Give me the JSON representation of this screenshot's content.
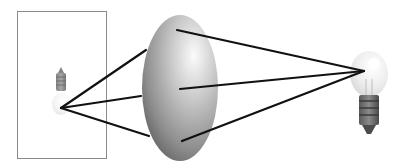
{
  "diagram": {
    "title": "",
    "colors": {
      "background": "#ffffff",
      "frame": "#8a8a8a",
      "rays": "#111111",
      "lens_light": "#f2f2f2",
      "lens_dark": "#6a6a6a"
    },
    "frame": {
      "x": 17,
      "y": 11,
      "width": 89,
      "height": 147
    },
    "object_bulb": {
      "cx": 61,
      "cy": 90,
      "orientation": "upright"
    },
    "lens": {
      "cx": 180,
      "cy": 88,
      "rx": 38,
      "ry": 73
    },
    "left_focus": {
      "x": 61,
      "y": 108
    },
    "right_focus": {
      "x": 364,
      "y": 71
    },
    "image_bulb": {
      "cx": 370,
      "cy": 90,
      "orientation": "inverted"
    },
    "rays": [
      {
        "name": "top",
        "x1": 61,
        "y1": 108,
        "x2": 146,
        "y2": 50,
        "x3": 177,
        "y3": 30
      },
      {
        "name": "middle",
        "x1": 61,
        "y1": 108,
        "x2": 141,
        "y2": 96,
        "x3": 180,
        "y3": 89
      },
      {
        "name": "bottom",
        "x1": 61,
        "y1": 108,
        "x2": 149,
        "y2": 136,
        "x3": 182,
        "y3": 141
      }
    ]
  }
}
